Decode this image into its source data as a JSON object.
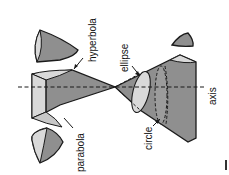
{
  "diagram": {
    "labels": {
      "hyperbola": "hyperbola",
      "parabola": "parabola",
      "ellipse": "ellipse",
      "circle": "circle",
      "axis": "axis"
    },
    "colors": {
      "dark_fill": "#8f8f8f",
      "light_fill": "#d9d9d9",
      "mid_fill": "#b0b0b0",
      "stroke": "#1a1a1a",
      "background": "#ffffff"
    }
  }
}
